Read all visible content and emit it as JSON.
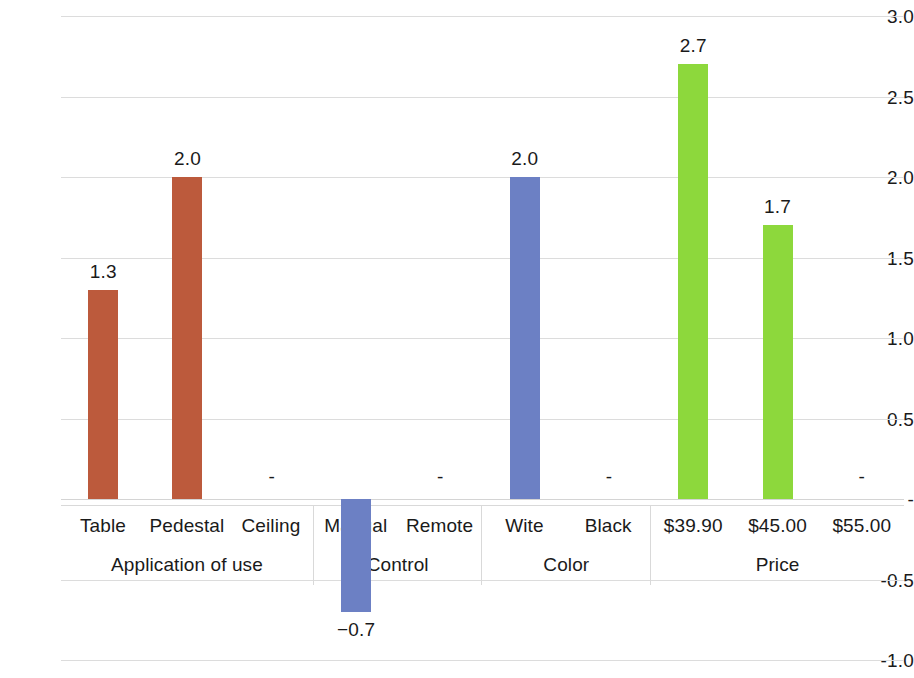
{
  "chart_data": {
    "type": "bar",
    "title": "",
    "subtitle": "",
    "xlabel": "",
    "ylabel": "",
    "ylim": [
      -1.0,
      3.0
    ],
    "ytick_labels": [
      "3.0",
      "2.5",
      "2.0",
      "1.5",
      "1.0",
      "0.5",
      "-",
      "-0.5",
      "-1.0"
    ],
    "ytick_values": [
      3.0,
      2.5,
      2.0,
      1.5,
      1.0,
      0.5,
      0.0,
      -0.5,
      -1.0
    ],
    "grid": true,
    "legend": "none",
    "zero_label_text": "-",
    "categories": [
      "Table",
      "Pedestal",
      "Ceiling",
      "Manual",
      "Remote",
      "Wite",
      "Black",
      "$39.90",
      "$45.00",
      "$55.00"
    ],
    "values": [
      1.3,
      2.0,
      0.0,
      -0.7,
      0.0,
      2.0,
      0.0,
      2.7,
      1.7,
      0.0
    ],
    "value_labels": [
      "1.3",
      "2.0",
      "-",
      "−0.7",
      "-",
      "2.0",
      "-",
      "2.7",
      "1.7",
      "-"
    ],
    "bar_colors": [
      "#BC5A3C",
      "#BC5A3C",
      "#BC5A3C",
      "#6C80C4",
      "#6C80C4",
      "#6C80C4",
      "#6C80C4",
      "#8DD83C",
      "#8DD83C",
      "#8DD83C"
    ],
    "groups": [
      {
        "label": "Application of use",
        "color": "#BC5A3C",
        "items": [
          {
            "label": "Table",
            "value": 1.3,
            "value_label": "1.3"
          },
          {
            "label": "Pedestal",
            "value": 2.0,
            "value_label": "2.0"
          },
          {
            "label": "Ceiling",
            "value": 0.0,
            "value_label": "-"
          }
        ]
      },
      {
        "label": "Control",
        "color": "#6C80C4",
        "items": [
          {
            "label": "Manual",
            "value": -0.7,
            "value_label": "−0.7"
          },
          {
            "label": "Remote",
            "value": 0.0,
            "value_label": "-"
          }
        ]
      },
      {
        "label": "Color",
        "color": "#6C80C4",
        "items": [
          {
            "label": "Wite",
            "value": 2.0,
            "value_label": "2.0"
          },
          {
            "label": "Black",
            "value": 0.0,
            "value_label": "-"
          }
        ]
      },
      {
        "label": "Price",
        "color": "#8DD83C",
        "items": [
          {
            "label": "$39.90",
            "value": 2.7,
            "value_label": "2.7"
          },
          {
            "label": "$45.00",
            "value": 1.7,
            "value_label": "1.7"
          },
          {
            "label": "$55.00",
            "value": 0.0,
            "value_label": "-"
          }
        ]
      }
    ],
    "colors": {
      "series_application": "#BC5A3C",
      "series_control": "#6C80C4",
      "series_color": "#6C80C4",
      "series_price": "#8DD83C",
      "gridline": "#DCDCDC",
      "text": "#1A1A1A",
      "background": "#FFFFFF"
    }
  }
}
